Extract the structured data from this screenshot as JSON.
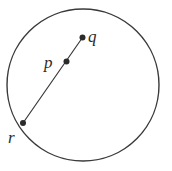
{
  "figure": {
    "type": "geometry-diagram",
    "background_color": "#ffffff",
    "stroke_color": "#3a3a3a",
    "label_color": "#2b2b2b",
    "circle": {
      "name": "circle",
      "cx": 83,
      "cy": 85,
      "r": 76,
      "stroke_width": 1.4,
      "fill": "none"
    },
    "segment": {
      "name": "segment-r-q",
      "x1": 23,
      "y1": 123,
      "x2": 82.5,
      "y2": 37.5,
      "stroke_width": 1.2
    },
    "points": [
      {
        "id": "q",
        "label": "q",
        "x": 82.5,
        "y": 37.5,
        "radius": 3,
        "label_x": 88,
        "label_y": 42
      },
      {
        "id": "p",
        "label": "p",
        "x": 66.5,
        "y": 61.5,
        "radius": 3,
        "label_x": 44,
        "label_y": 68
      },
      {
        "id": "r",
        "label": "r",
        "x": 23,
        "y": 123,
        "radius": 3,
        "label_x": 8,
        "label_y": 143
      }
    ]
  }
}
